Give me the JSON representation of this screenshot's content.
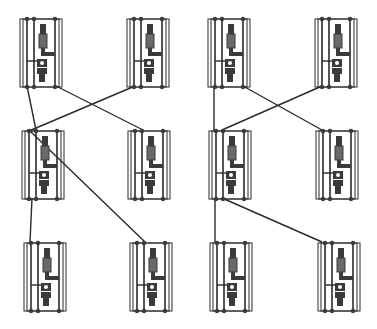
{
  "diagram": {
    "width": 377,
    "height": 329,
    "background": "#ffffff",
    "stroke_color": "#2a2a2a",
    "fill_dark": "#3a3a3a",
    "fill_hatch": "#6a6a6a",
    "cell_size": {
      "w": 42,
      "h": 70
    },
    "cells": [
      {
        "id": "r1c1",
        "x": 20,
        "y": 17
      },
      {
        "id": "r1c2",
        "x": 127,
        "y": 17
      },
      {
        "id": "r1c3",
        "x": 208,
        "y": 17
      },
      {
        "id": "r1c4",
        "x": 315,
        "y": 17
      },
      {
        "id": "r2c1",
        "x": 22,
        "y": 129
      },
      {
        "id": "r2c2",
        "x": 128,
        "y": 129
      },
      {
        "id": "r2c3",
        "x": 209,
        "y": 129
      },
      {
        "id": "r2c4",
        "x": 316,
        "y": 129
      },
      {
        "id": "r3c1",
        "x": 24,
        "y": 241
      },
      {
        "id": "r3c2",
        "x": 130,
        "y": 241
      },
      {
        "id": "r3c3",
        "x": 210,
        "y": 241
      },
      {
        "id": "r3c4",
        "x": 318,
        "y": 241
      }
    ],
    "connections": [
      {
        "from": [
          27,
          86
        ],
        "to": [
          36,
          130
        ]
      },
      {
        "from": [
          56,
          86
        ],
        "to": [
          143,
          130
        ]
      },
      {
        "from": [
          135,
          86
        ],
        "to": [
          29,
          131
        ]
      },
      {
        "from": [
          30,
          131
        ],
        "to": [
          145,
          242
        ]
      },
      {
        "from": [
          32,
          198
        ],
        "to": [
          30,
          242
        ]
      },
      {
        "from": [
          214,
          86
        ],
        "to": [
          214,
          130
        ]
      },
      {
        "from": [
          243,
          86
        ],
        "to": [
          322,
          130
        ]
      },
      {
        "from": [
          322,
          86
        ],
        "to": [
          222,
          130
        ]
      },
      {
        "from": [
          215,
          198
        ],
        "to": [
          215,
          242
        ]
      },
      {
        "from": [
          222,
          198
        ],
        "to": [
          322,
          242
        ]
      }
    ]
  }
}
